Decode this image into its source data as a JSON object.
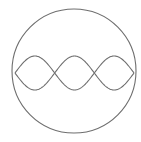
{
  "diagram": {
    "background": "#ffffff",
    "stroke_color": "#6e6e6e",
    "circle": {
      "cx": 74,
      "cy": 71,
      "r": 62
    },
    "wave": {
      "x_start": 15,
      "x_end": 134,
      "center_y": 73,
      "amplitude": 17,
      "loops": 3
    }
  }
}
